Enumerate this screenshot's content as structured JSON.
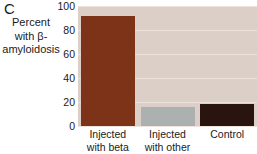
{
  "panel": {
    "letter": "C"
  },
  "chart_data": {
    "type": "bar",
    "title": "",
    "xlabel": "",
    "ylabel": "Percent with β-amyloidosis",
    "ylabel_lines": [
      "Percent",
      "with β-",
      "amyloidosis"
    ],
    "categories": [
      "Injected with beta",
      "Injected with other",
      "Control"
    ],
    "category_lines": [
      [
        "Injected",
        "with beta"
      ],
      [
        "Injected",
        "with other"
      ],
      [
        "Control",
        ""
      ]
    ],
    "values": [
      92,
      16,
      18
    ],
    "bar_colors": [
      "#7d3318",
      "#acb0b0",
      "#2a1410"
    ],
    "ylim": [
      0,
      100
    ],
    "yticks": [
      100,
      80,
      60,
      40,
      20,
      0
    ],
    "ytick_labels": [
      "100",
      "80",
      "60",
      "40",
      "20",
      "0"
    ],
    "grid": true,
    "legend": "none",
    "plot_background": "#dbcfc7",
    "gridline_color": "#ece3dd"
  }
}
